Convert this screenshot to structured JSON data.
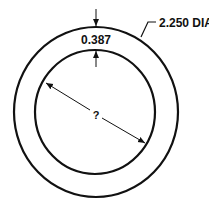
{
  "diagram": {
    "type": "engineering-drawing",
    "outer_diameter_label": "2.250 DIA",
    "wall_thickness_label": "0.387",
    "inner_diameter_label": "?",
    "colors": {
      "line": "#111111",
      "background": "#ffffff"
    }
  }
}
